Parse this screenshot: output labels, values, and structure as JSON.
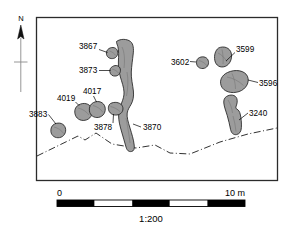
{
  "figure": {
    "type": "archaeological-site-plan",
    "scale_ratio": "1:200",
    "north_label": "N"
  },
  "scalebar": {
    "start_label": "0",
    "end_label": "10 m",
    "ratio_label": "1:200",
    "segments": 4,
    "segment_colors": [
      "#000000",
      "#ffffff",
      "#000000",
      "#ffffff",
      "#000000"
    ]
  },
  "colors": {
    "feature_fill": "#9c9c9c",
    "feature_stroke": "#1a1a1a",
    "frame_stroke": "#2b2b2b",
    "boundary_stroke": "#1a1a1a",
    "background": "#ffffff"
  },
  "features": [
    {
      "id": "3867",
      "label": "3867",
      "shape": "small-oval",
      "group": "west-cluster"
    },
    {
      "id": "3873",
      "label": "3873",
      "shape": "small-oval",
      "group": "west-cluster"
    },
    {
      "id": "4019",
      "label": "4019",
      "shape": "round-blob",
      "group": "west-cluster"
    },
    {
      "id": "4017",
      "label": "4017",
      "shape": "round-blob",
      "group": "west-cluster"
    },
    {
      "id": "3883",
      "label": "3883",
      "shape": "round-blob",
      "group": "west-cluster"
    },
    {
      "id": "3878",
      "label": "3878",
      "shape": "small-oval",
      "group": "west-cluster"
    },
    {
      "id": "3870",
      "label": "3870",
      "shape": "long-linear",
      "group": "west-cluster"
    },
    {
      "id": "3602",
      "label": "3602",
      "shape": "small-oval",
      "group": "east-cluster"
    },
    {
      "id": "3599",
      "label": "3599",
      "shape": "oval",
      "group": "east-cluster"
    },
    {
      "id": "3596",
      "label": "3596",
      "shape": "large-oval",
      "group": "east-cluster"
    },
    {
      "id": "3240",
      "label": "3240",
      "shape": "elongated-bar",
      "group": "east-cluster"
    }
  ]
}
